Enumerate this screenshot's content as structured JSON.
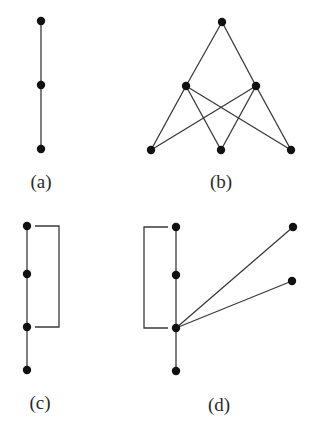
{
  "figure": {
    "panels": [
      {
        "id": "a",
        "label": "(a)",
        "label_pos": [
          41,
          188
        ],
        "nodes": [
          [
            41,
            21
          ],
          [
            41,
            85
          ],
          [
            41,
            149
          ]
        ],
        "edges": [
          [
            0,
            1
          ],
          [
            1,
            2
          ]
        ],
        "brackets": [],
        "polylines": []
      },
      {
        "id": "b",
        "label": "(b)",
        "label_pos": [
          221,
          188
        ],
        "nodes": [
          [
            222,
            22
          ],
          [
            186,
            86
          ],
          [
            256,
            86
          ],
          [
            151,
            150
          ],
          [
            221,
            150
          ],
          [
            291,
            150
          ]
        ],
        "edges": [
          [
            0,
            1
          ],
          [
            0,
            2
          ],
          [
            1,
            3
          ],
          [
            1,
            4
          ],
          [
            1,
            5
          ],
          [
            2,
            3
          ],
          [
            2,
            4
          ],
          [
            2,
            5
          ]
        ],
        "brackets": [],
        "polylines": []
      },
      {
        "id": "c",
        "label": "(c)",
        "label_pos": [
          40,
          409
        ],
        "nodes": [
          [
            27,
            226
          ],
          [
            27,
            274
          ],
          [
            27,
            327
          ],
          [
            27,
            370
          ]
        ],
        "edges": [
          [
            0,
            1
          ],
          [
            1,
            2
          ],
          [
            2,
            3
          ]
        ],
        "brackets": [
          {
            "points": [
              [
                35,
                226
              ],
              [
                59,
                226
              ],
              [
                59,
                327
              ],
              [
                35,
                327
              ]
            ]
          }
        ],
        "polylines": []
      },
      {
        "id": "d",
        "label": "(d)",
        "label_pos": [
          219,
          411
        ],
        "nodes": [
          [
            176,
            227
          ],
          [
            176,
            275
          ],
          [
            176,
            328
          ],
          [
            176,
            371
          ],
          [
            293,
            227
          ],
          [
            292,
            281
          ]
        ],
        "edges": [
          [
            0,
            1
          ],
          [
            1,
            2
          ],
          [
            2,
            3
          ],
          [
            2,
            4
          ],
          [
            2,
            5
          ]
        ],
        "brackets": [
          {
            "points": [
              [
                168,
                227
              ],
              [
                144,
                227
              ],
              [
                144,
                328
              ],
              [
                168,
                328
              ]
            ]
          }
        ],
        "polylines": []
      }
    ],
    "node_radius": 4.2,
    "colors": {
      "node": "#111111",
      "edge": "#3a3a3a",
      "label": "#2a2a2a",
      "background": "#ffffff"
    }
  }
}
